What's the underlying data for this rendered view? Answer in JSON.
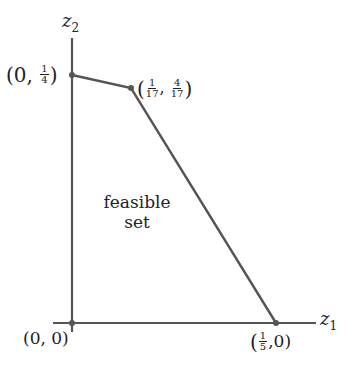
{
  "diagram": {
    "axes": {
      "x_label": "z",
      "x_sub": "1",
      "y_label": "z",
      "y_sub": "2"
    },
    "region_label_line1": "feasible",
    "region_label_line2": "set",
    "vertices": [
      {
        "name": "origin",
        "text": "(0, 0)"
      },
      {
        "name": "y-intercept",
        "prefix": "(0, ",
        "num": "1",
        "den": "4",
        "suffix": ")"
      },
      {
        "name": "corner",
        "num1": "1",
        "den1": "17",
        "num2": "4",
        "den2": "17"
      },
      {
        "name": "x-intercept",
        "num": "1",
        "den": "5",
        "suffix": ",0)"
      }
    ],
    "colors": {
      "line": "#555555",
      "text": "#222222",
      "background": "#ffffff"
    }
  }
}
